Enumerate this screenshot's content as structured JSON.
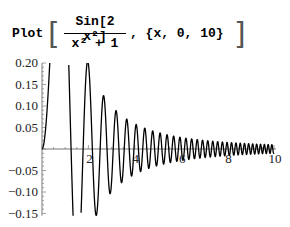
{
  "input": {
    "function_name": "Plot",
    "numerator": "Sin[2 x²]",
    "denominator": "x² + 1",
    "range": ", {x, 0, 10}"
  },
  "chart_data": {
    "type": "line",
    "title": "",
    "expression": "Sin[2 x^2]/(x^2 + 1)",
    "xlabel": "",
    "ylabel": "",
    "xlim": [
      0,
      10
    ],
    "ylim": [
      -0.155,
      0.2
    ],
    "x_ticks": [
      2,
      4,
      6,
      8,
      10
    ],
    "x_tick_labels": [
      "2",
      "4",
      "6",
      "8",
      "10"
    ],
    "y_ticks": [
      0.2,
      0.15,
      0.1,
      0.05,
      -0.05,
      -0.1,
      -0.15
    ],
    "y_tick_labels": [
      "0.20",
      "0.15",
      "0.10",
      "0.05",
      "−0.05",
      "−0.10",
      "−0.15"
    ],
    "grid": false,
    "legend": "none",
    "line_color": "#000000",
    "series": [
      {
        "name": "Sin[2 x^2]/(x^2+1)",
        "x_range": [
          0,
          10
        ],
        "samples": 2000
      }
    ]
  }
}
